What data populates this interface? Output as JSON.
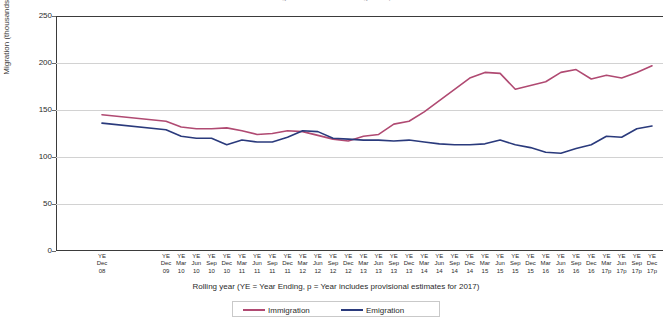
{
  "chart_data": {
    "type": "line",
    "title": "Long-Term International Migration, UK",
    "xlabel": "Rolling year (YE = Year Ending, p = Year includes provisional  estimates for  2017)",
    "ylabel": "Migration (thousands)",
    "ylim": [
      0,
      250
    ],
    "yticks": [
      0,
      50,
      100,
      150,
      200,
      250
    ],
    "grid": true,
    "legend_position": "bottom",
    "categories": [
      "YE Dec 08",
      "YE Dec 09",
      "YE Mar 10",
      "YE Jun 10",
      "YE Sep 10",
      "YE Dec 10",
      "YE Mar 11",
      "YE Jun 11",
      "YE Sep 11",
      "YE Dec 11",
      "YE Mar 12",
      "YE Jun 12",
      "YE Sep 12",
      "YE Dec 12",
      "YE Mar 13",
      "YE Jun 13",
      "YE Sep 13",
      "YE Dec 13",
      "YE Mar 14",
      "YE Jun 14",
      "YE Sep 14",
      "YE Dec 14",
      "YE Mar 15",
      "YE Jun 15",
      "YE Sep 15",
      "YE Dec 15",
      "YE Mar 16",
      "YE Jun 16",
      "YE Sep 16",
      "YE Dec 16",
      "YE Mar 17p",
      "YE Jun 17p",
      "YE Sep 17p",
      "YE Dec 17p"
    ],
    "category_lines": [
      [
        "YE",
        "Dec",
        "08"
      ],
      [
        "YE",
        "Dec",
        "09"
      ],
      [
        "YE",
        "Mar",
        "10"
      ],
      [
        "YE",
        "Jun",
        "10"
      ],
      [
        "YE",
        "Sep",
        "10"
      ],
      [
        "YE",
        "Dec",
        "10"
      ],
      [
        "YE",
        "Mar",
        "11"
      ],
      [
        "YE",
        "Jun",
        "11"
      ],
      [
        "YE",
        "Sep",
        "11"
      ],
      [
        "YE",
        "Dec",
        "11"
      ],
      [
        "YE",
        "Mar",
        "12"
      ],
      [
        "YE",
        "Jun",
        "12"
      ],
      [
        "YE",
        "Sep",
        "12"
      ],
      [
        "YE",
        "Dec",
        "12"
      ],
      [
        "YE",
        "Mar",
        "13"
      ],
      [
        "YE",
        "Jun",
        "13"
      ],
      [
        "YE",
        "Sep",
        "13"
      ],
      [
        "YE",
        "Dec",
        "13"
      ],
      [
        "YE",
        "Mar",
        "14"
      ],
      [
        "YE",
        "Jun",
        "14"
      ],
      [
        "YE",
        "Sep",
        "14"
      ],
      [
        "YE",
        "Dec",
        "14"
      ],
      [
        "YE",
        "Mar",
        "15"
      ],
      [
        "YE",
        "Jun",
        "15"
      ],
      [
        "YE",
        "Sep",
        "15"
      ],
      [
        "YE",
        "Dec",
        "15"
      ],
      [
        "YE",
        "Mar",
        "16"
      ],
      [
        "YE",
        "Jun",
        "16"
      ],
      [
        "YE",
        "Sep",
        "16"
      ],
      [
        "YE",
        "Dec",
        "16"
      ],
      [
        "YE",
        "Mar",
        "17p"
      ],
      [
        "YE",
        "Jun",
        "17p"
      ],
      [
        "YE",
        "Sep",
        "17p"
      ],
      [
        "YE",
        "Dec",
        "17p"
      ]
    ],
    "series": [
      {
        "name": "Immigration",
        "color": "#b04a72",
        "values": [
          145,
          138,
          132,
          130,
          130,
          131,
          128,
          124,
          125,
          128,
          127,
          123,
          119,
          117,
          122,
          124,
          135,
          138,
          148,
          160,
          172,
          184,
          190,
          189,
          172,
          176,
          180,
          190,
          193,
          183,
          187,
          184,
          190,
          197
        ]
      },
      {
        "name": "Emigration",
        "color": "#2a3a7c",
        "values": [
          136,
          129,
          122,
          120,
          120,
          113,
          118,
          116,
          116,
          121,
          128,
          127,
          120,
          119,
          118,
          118,
          117,
          118,
          116,
          114,
          113,
          113,
          114,
          118,
          113,
          110,
          105,
          104,
          109,
          113,
          122,
          121,
          130,
          133
        ]
      }
    ]
  },
  "legend": {
    "items": [
      {
        "label": "Immigration",
        "color": "#b04a72"
      },
      {
        "label": "Emigration",
        "color": "#2a3a7c"
      }
    ]
  }
}
